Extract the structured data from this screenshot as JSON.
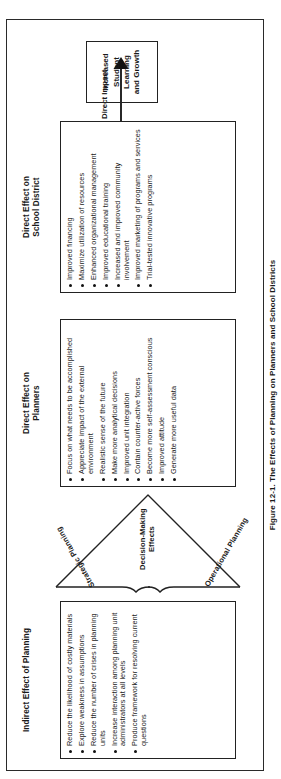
{
  "figure": {
    "caption": "Figure 12-1. The Effects of Planning on Planners and School Districts"
  },
  "columns": {
    "indirect": {
      "title": "Indirect Effect of Planning",
      "items": [
        "Reduce the likelihood of costly materials",
        "Explore weakness in assumptions",
        "Reduce the number of crises in planning units",
        "Increase interaction among planning unit administrators at all levels",
        "Produce framework for resolving current questions"
      ]
    },
    "planners": {
      "title": "Direct Effect on Planners",
      "items": [
        "Focus on what needs to be accomplished",
        "Appreciate impact of the external environment",
        "Realistic sense of the future",
        "Make more analytical decisions",
        "Improved unit integration",
        "Contain counter-active forces",
        "Become more self-assessment conscious",
        "Improved attitude",
        "Generate more useful data"
      ]
    },
    "district": {
      "title": "Direct Effect on School District",
      "items": [
        "Improved financing",
        "Maximize utilization of resources",
        "Enhanced organizational management",
        "Improved educational training",
        "Increased and improved community involvement",
        "Improved marketing of programs and services",
        "Trial-tested innovative programs"
      ]
    }
  },
  "funnel": {
    "strategic_label": "Strategic Planning",
    "operational_label": "Operational Planning",
    "decision_label": "Decision-Making Effects"
  },
  "impact": {
    "arrow_label": "Direct Impact",
    "outcome": "Increased Student Learning and Growth"
  },
  "colors": {
    "ink": "#222222",
    "paper": "#ffffff"
  }
}
